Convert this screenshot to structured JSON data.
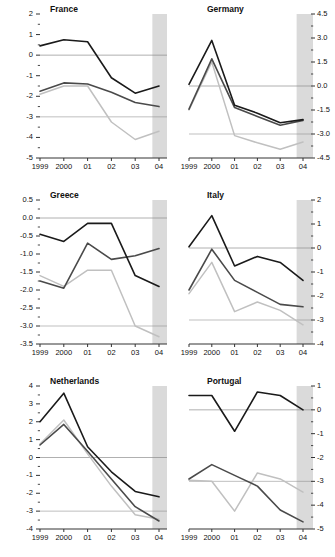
{
  "figure": {
    "type": "small-multiples-line-grid",
    "columns": 2,
    "rows": 3,
    "background": "#ffffff",
    "forecast_band_color": "#d4d4d4",
    "zero_line_color": "#8a8a8a",
    "axis_color": "#333333",
    "series_colors": [
      "#1a1a1a",
      "#4a4a4a",
      "#c0c0c0"
    ],
    "shared_x_categories": [
      "1999",
      "2000",
      "01",
      "02",
      "03",
      "04"
    ],
    "forecast_starts_at": "04",
    "legend": "none"
  },
  "chart_data": [
    {
      "type": "line",
      "title": "France",
      "xlabel": "",
      "ylabel": "",
      "categories": [
        "1999",
        "2000",
        "01",
        "02",
        "03",
        "04"
      ],
      "x": [
        1999,
        2000,
        2001,
        2002,
        2003,
        2004
      ],
      "ylim": [
        -5,
        2
      ],
      "yticks": [
        2,
        1,
        0,
        -1,
        -2,
        -3,
        -4,
        -5
      ],
      "ytick_labels": [
        "2",
        "1",
        "0",
        "-1",
        "-2",
        "-3",
        "-4",
        "-5"
      ],
      "minor_ticks": true,
      "axis_side": "left",
      "grid": false,
      "zero_line": true,
      "reference_lines": [
        0,
        -3
      ],
      "shaded_region": {
        "from": "03.75",
        "to": "04",
        "label": "forecast"
      },
      "series": [
        {
          "name": "series-1-dark",
          "values": [
            0.45,
            0.75,
            0.65,
            -1.1,
            -1.85,
            -1.5
          ]
        },
        {
          "name": "series-2-dark",
          "values": [
            -1.75,
            -1.35,
            -1.4,
            -1.8,
            -2.3,
            -2.5
          ]
        },
        {
          "name": "series-3-light",
          "values": [
            -1.9,
            -1.5,
            -1.5,
            -3.25,
            -4.1,
            -3.7
          ]
        }
      ]
    },
    {
      "type": "line",
      "title": "Germany",
      "xlabel": "",
      "ylabel": "",
      "categories": [
        "1999",
        "2000",
        "01",
        "02",
        "03",
        "04"
      ],
      "x": [
        1999,
        2000,
        2001,
        2002,
        2003,
        2004
      ],
      "ylim": [
        -4.5,
        4.5
      ],
      "yticks": [
        4.5,
        3.0,
        1.5,
        0.0,
        -1.5,
        -3.0,
        -4.5
      ],
      "ytick_labels": [
        "4.5",
        "3.0",
        "1.5",
        "0.0",
        "-1.5",
        "-3.0",
        "-4.5"
      ],
      "minor_ticks": true,
      "axis_side": "right",
      "grid": false,
      "zero_line": true,
      "reference_lines": [
        0.0,
        -3.0
      ],
      "shaded_region": {
        "from": "03.75",
        "to": "04",
        "label": "forecast"
      },
      "series": [
        {
          "name": "series-1-dark",
          "values": [
            0.1,
            2.85,
            -1.2,
            -1.7,
            -2.3,
            -2.1
          ]
        },
        {
          "name": "series-2-dark",
          "values": [
            -1.45,
            1.7,
            -1.35,
            -1.9,
            -2.45,
            -2.15
          ]
        },
        {
          "name": "series-3-light",
          "values": [
            -1.5,
            1.5,
            -3.1,
            -3.55,
            -3.95,
            -3.5
          ]
        }
      ]
    },
    {
      "type": "line",
      "title": "Greece",
      "xlabel": "",
      "ylabel": "",
      "categories": [
        "1999",
        "2000",
        "01",
        "02",
        "03",
        "04"
      ],
      "x": [
        1999,
        2000,
        2001,
        2002,
        2003,
        2004
      ],
      "ylim": [
        -3.5,
        0.5
      ],
      "yticks": [
        0.5,
        0.0,
        -0.5,
        -1.0,
        -1.5,
        -2.0,
        -2.5,
        -3.0,
        -3.5
      ],
      "ytick_labels": [
        "0.5",
        "0.0",
        "-0.5",
        "-1.0",
        "-1.5",
        "-2.0",
        "-2.5",
        "-3.0",
        "-3.5"
      ],
      "minor_ticks": true,
      "axis_side": "left",
      "grid": false,
      "zero_line": true,
      "reference_lines": [
        0.0,
        -3.0
      ],
      "shaded_region": {
        "from": "03.75",
        "to": "04",
        "label": "forecast"
      },
      "series": [
        {
          "name": "series-1-dark",
          "values": [
            -0.45,
            -0.65,
            -0.15,
            -0.15,
            -1.6,
            -1.9
          ]
        },
        {
          "name": "series-2-dark",
          "values": [
            -1.75,
            -1.95,
            -0.7,
            -1.15,
            -1.05,
            -0.85
          ]
        },
        {
          "name": "series-3-light",
          "values": [
            -1.6,
            -1.9,
            -1.45,
            -1.45,
            -3.0,
            -3.3
          ]
        }
      ]
    },
    {
      "type": "line",
      "title": "Italy",
      "xlabel": "",
      "ylabel": "",
      "categories": [
        "1999",
        "2000",
        "01",
        "02",
        "03",
        "04"
      ],
      "x": [
        1999,
        2000,
        2001,
        2002,
        2003,
        2004
      ],
      "ylim": [
        -4,
        2
      ],
      "yticks": [
        2,
        1,
        0,
        -1,
        -2,
        -3,
        -4
      ],
      "ytick_labels": [
        "2",
        "1",
        "0",
        "-1",
        "-2",
        "-3",
        "-4"
      ],
      "minor_ticks": true,
      "axis_side": "right",
      "grid": false,
      "zero_line": true,
      "reference_lines": [
        0,
        -3
      ],
      "shaded_region": {
        "from": "03.75",
        "to": "04",
        "label": "forecast"
      },
      "series": [
        {
          "name": "series-1-dark",
          "values": [
            0.05,
            1.35,
            -0.75,
            -0.35,
            -0.6,
            -1.35
          ]
        },
        {
          "name": "series-2-dark",
          "values": [
            -1.75,
            -0.05,
            -1.35,
            -1.85,
            -2.35,
            -2.45
          ]
        },
        {
          "name": "series-3-light",
          "values": [
            -1.9,
            -0.6,
            -2.65,
            -2.25,
            -2.6,
            -3.2
          ]
        }
      ]
    },
    {
      "type": "line",
      "title": "Netherlands",
      "xlabel": "",
      "ylabel": "",
      "categories": [
        "1999",
        "2000",
        "01",
        "02",
        "03",
        "04"
      ],
      "x": [
        1999,
        2000,
        2001,
        2002,
        2003,
        2004
      ],
      "ylim": [
        -4,
        4
      ],
      "yticks": [
        4,
        3,
        2,
        1,
        0,
        -1,
        -2,
        -3,
        -4
      ],
      "ytick_labels": [
        "4",
        "3",
        "2",
        "1",
        "0",
        "-1",
        "-2",
        "-3",
        "-4"
      ],
      "minor_ticks": true,
      "axis_side": "left",
      "grid": false,
      "zero_line": true,
      "reference_lines": [
        0,
        -3
      ],
      "shaded_region": {
        "from": "03.75",
        "to": "04",
        "label": "forecast"
      },
      "series": [
        {
          "name": "series-1-dark",
          "values": [
            2.0,
            3.6,
            0.6,
            -0.8,
            -1.9,
            -2.2
          ]
        },
        {
          "name": "series-2-dark",
          "values": [
            0.7,
            1.85,
            0.35,
            -1.2,
            -2.75,
            -3.55
          ]
        },
        {
          "name": "series-3-light",
          "values": [
            0.75,
            2.1,
            0.2,
            -1.6,
            -3.2,
            -3.45
          ]
        }
      ]
    },
    {
      "type": "line",
      "title": "Portugal",
      "xlabel": "",
      "ylabel": "",
      "categories": [
        "1999",
        "2000",
        "01",
        "02",
        "03",
        "04"
      ],
      "x": [
        1999,
        2000,
        2001,
        2002,
        2003,
        2004
      ],
      "ylim": [
        -5,
        1
      ],
      "yticks": [
        1,
        0,
        -1,
        -2,
        -3,
        -4,
        -5
      ],
      "ytick_labels": [
        "1",
        "0",
        "-1",
        "-2",
        "-3",
        "-4",
        "-5"
      ],
      "minor_ticks": true,
      "axis_side": "right",
      "grid": false,
      "zero_line": true,
      "reference_lines": [
        0,
        -3
      ],
      "shaded_region": {
        "from": "03.75",
        "to": "04",
        "label": "forecast"
      },
      "series": [
        {
          "name": "series-1-dark",
          "values": [
            0.6,
            0.6,
            -0.9,
            0.75,
            0.6,
            0.0
          ]
        },
        {
          "name": "series-2-dark",
          "values": [
            -2.9,
            -2.3,
            -2.75,
            -3.2,
            -4.2,
            -4.7
          ]
        },
        {
          "name": "series-3-light",
          "values": [
            -2.95,
            -3.0,
            -4.25,
            -2.65,
            -2.9,
            -3.45
          ]
        }
      ]
    }
  ]
}
